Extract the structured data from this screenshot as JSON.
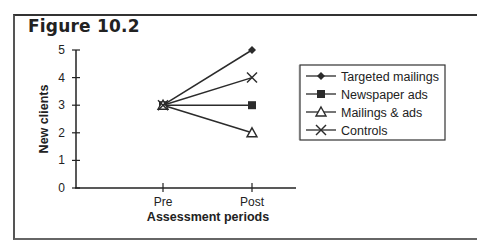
{
  "figure": {
    "title": "Figure 10.2"
  },
  "chart_data": {
    "type": "line",
    "title": "Figure 10.2",
    "xlabel": "Assessment periods",
    "ylabel": "New clients",
    "categories": [
      "Pre",
      "Post"
    ],
    "ylim": [
      0,
      5
    ],
    "yticks": [
      "0",
      "1",
      "2",
      "3",
      "4",
      "5"
    ],
    "grid": false,
    "legend_position": "right",
    "series": [
      {
        "name": "Targeted mailings",
        "marker": "diamond",
        "values": [
          3,
          5
        ]
      },
      {
        "name": "Newspaper ads",
        "marker": "square",
        "values": [
          3,
          3
        ]
      },
      {
        "name": "Mailings & ads",
        "marker": "triangle",
        "values": [
          3,
          2
        ]
      },
      {
        "name": "Controls",
        "marker": "x",
        "values": [
          3,
          4
        ]
      }
    ]
  },
  "axes": {
    "y_ticks": [
      "0",
      "1",
      "2",
      "3",
      "4",
      "5"
    ],
    "x_ticks": [
      "Pre",
      "Post"
    ],
    "x_title": "Assessment periods",
    "y_title": "New clients"
  },
  "legend": {
    "items": [
      {
        "label": "Targeted mailings"
      },
      {
        "label": "Newspaper ads"
      },
      {
        "label": "Mailings & ads"
      },
      {
        "label": "Controls"
      }
    ]
  },
  "colors": {
    "line": "#2b2b2b",
    "frame": "#444444"
  }
}
